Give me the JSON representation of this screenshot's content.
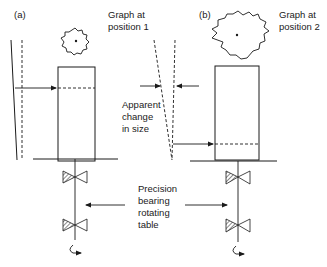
{
  "diagram": {
    "panel_a": {
      "tag": "(a)",
      "caption_line1": "Graph at",
      "caption_line2": "position 1"
    },
    "panel_b": {
      "tag": "(b)",
      "caption_line1": "Graph at",
      "caption_line2": "position 2"
    },
    "center_label": {
      "line1": "Apparent",
      "line2": "change",
      "line3": "in size"
    },
    "bearing_label": {
      "line1": "Precision",
      "line2": "bearing",
      "line3": "rotating",
      "line4": "table"
    },
    "colors": {
      "line": "#1a1a1a",
      "background": "#ffffff"
    }
  }
}
